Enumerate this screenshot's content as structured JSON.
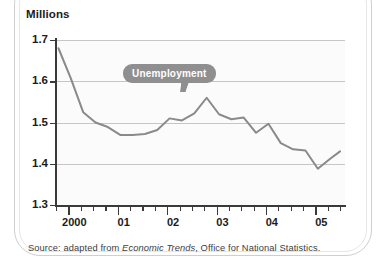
{
  "figure": {
    "axis_title": "Millions",
    "callout_label": "Unemployment",
    "source_prefix": "Source: adapted from ",
    "source_italic": "Economic Trends",
    "source_suffix": ", Office for National Statistics.",
    "line_color": "#8a8a8a",
    "gridline_color": "#c6c6c6",
    "axis_color": "#3a3a3a",
    "callout_color": "#8f8f8f",
    "plot_background": "#fbfbfb"
  },
  "chart_data": {
    "type": "line",
    "title": "",
    "subtitle": "",
    "xlabel": "",
    "ylabel": "Millions",
    "ylim": [
      1.3,
      1.7
    ],
    "xlim": [
      1999.75,
      2005.6
    ],
    "grid": true,
    "legend": "callout-annotation",
    "annotations": [
      {
        "text": "Unemployment",
        "style": "speech-bubble",
        "x": 2001.4,
        "y": 1.595
      }
    ],
    "ytick_labels": [
      "1.7",
      "1.6",
      "1.5",
      "1.4",
      "1.3"
    ],
    "ytick_values": [
      1.7,
      1.6,
      1.5,
      1.4,
      1.3
    ],
    "xtick_labels": [
      "2000",
      "01",
      "02",
      "03",
      "04",
      "05"
    ],
    "xtick_values": [
      2000,
      2001,
      2002,
      2003,
      2004,
      2005
    ],
    "minor_ticks_per_major": 4,
    "series": [
      {
        "name": "Unemployment",
        "x": [
          1999.8,
          2000.05,
          2000.3,
          2000.55,
          2000.8,
          2001.05,
          2001.3,
          2001.55,
          2001.8,
          2002.05,
          2002.3,
          2002.55,
          2002.8,
          2003.05,
          2003.3,
          2003.55,
          2003.8,
          2004.05,
          2004.3,
          2004.55,
          2004.8,
          2005.05,
          2005.3,
          2005.5
        ],
        "values": [
          1.68,
          1.607,
          1.525,
          1.5,
          1.489,
          1.47,
          1.47,
          1.472,
          1.482,
          1.51,
          1.505,
          1.522,
          1.56,
          1.52,
          1.508,
          1.512,
          1.475,
          1.497,
          1.45,
          1.435,
          1.432,
          1.388,
          1.412,
          1.43
        ]
      }
    ]
  }
}
